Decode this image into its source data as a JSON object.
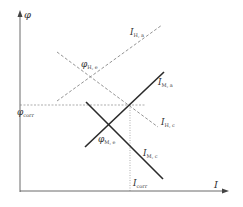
{
  "diagram": {
    "type": "evans-diagram",
    "axes": {
      "y_label": "φ",
      "x_label": "I"
    },
    "lines": [
      {
        "id": "I_H_a",
        "label_main": "I",
        "label_sub": "H, a",
        "style": "dashed",
        "direction": "rising"
      },
      {
        "id": "I_H_c",
        "label_main": "I",
        "label_sub": "H, c",
        "style": "dashed",
        "direction": "falling"
      },
      {
        "id": "I_M_a",
        "label_main": "I",
        "label_sub": "M, a",
        "style": "solid",
        "direction": "rising"
      },
      {
        "id": "I_M_c",
        "label_main": "I",
        "label_sub": "M, c",
        "style": "solid",
        "direction": "falling"
      }
    ],
    "points": [
      {
        "id": "phi_H_e",
        "label_main": "φ",
        "label_sub": "H, e"
      },
      {
        "id": "phi_M_e",
        "label_main": "φ",
        "label_sub": "M, e"
      }
    ],
    "guides": {
      "phi_corr": {
        "label_main": "φ",
        "label_sub": "corr"
      },
      "I_corr": {
        "label_main": "I",
        "label_sub": "corr"
      }
    },
    "colors": {
      "solid_line": "#2a2a2a",
      "dashed_line": "#777777",
      "axis": "#444444"
    }
  }
}
